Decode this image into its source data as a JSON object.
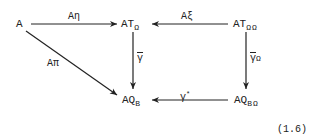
{
  "diagram": {
    "equation_number": "(1.6)",
    "nodes": {
      "A": {
        "label": "A"
      },
      "AT_Omega": {
        "base": "AT",
        "sub": "Ω"
      },
      "AT_OmegaOmega": {
        "base": "AT",
        "sub": "Ω",
        "extra": "Ω"
      },
      "AQ_B": {
        "base": "AQ",
        "sub": "B"
      },
      "AQ_B_Omega": {
        "base": "AQ",
        "sub": "B",
        "extra": "Ω"
      }
    },
    "arrows": [
      {
        "from": "A",
        "to": "AT_Omega",
        "label": "Aη"
      },
      {
        "from": "AT_OmegaOmega",
        "to": "AT_Omega",
        "label": "Aξ"
      },
      {
        "from": "A",
        "to": "AQ_B",
        "label": "Aπ"
      },
      {
        "from": "AT_Omega",
        "to": "AQ_B",
        "label": "γ"
      },
      {
        "from": "AT_OmegaOmega",
        "to": "AQ_B_Omega",
        "label": "γ",
        "label_suffix": "Ω"
      },
      {
        "from": "AQ_B_Omega",
        "to": "AQ_B",
        "label": "γ",
        "label_sup": "*"
      }
    ]
  }
}
